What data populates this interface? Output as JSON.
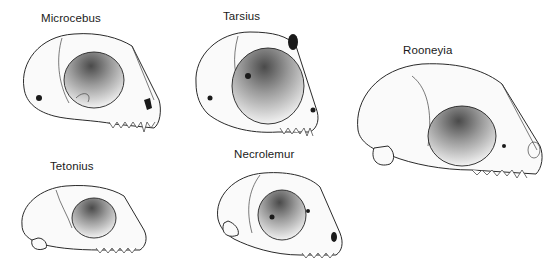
{
  "figure": {
    "specimens": [
      {
        "id": "microcebus",
        "label": "Microcebus"
      },
      {
        "id": "tarsius",
        "label": "Tarsius"
      },
      {
        "id": "rooneyia",
        "label": "Rooneyia"
      },
      {
        "id": "tetonius",
        "label": "Tetonius"
      },
      {
        "id": "necrolemur",
        "label": "Necrolemur"
      }
    ]
  }
}
